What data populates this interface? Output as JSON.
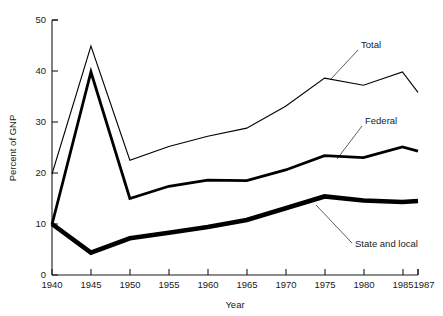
{
  "chart_data": {
    "type": "line",
    "title": "",
    "xlabel": "Year",
    "ylabel": "Percent of GNP",
    "x": [
      1940,
      1945,
      1950,
      1955,
      1960,
      1965,
      1970,
      1975,
      1980,
      1985,
      1987
    ],
    "xtick_labels": [
      "1940",
      "1945",
      "1950",
      "1955",
      "1960",
      "1965",
      "1970",
      "1975",
      "1980",
      "1985",
      "1987"
    ],
    "ytick_labels": [
      "0",
      "10",
      "20",
      "30",
      "40",
      "50"
    ],
    "yticks": [
      0,
      10,
      20,
      30,
      40,
      50
    ],
    "ylim": [
      0,
      50
    ],
    "xlim": [
      1940,
      1987
    ],
    "grid": false,
    "legend_position": "inline-annotations",
    "series": [
      {
        "name": "Total",
        "label": "Total",
        "values": [
          19.8,
          44.9,
          22.5,
          25.2,
          27.2,
          28.8,
          33.1,
          38.6,
          37.2,
          39.8,
          35.8
        ]
      },
      {
        "name": "Federal",
        "label": "Federal",
        "values": [
          9.9,
          39.8,
          15.0,
          17.4,
          18.6,
          18.5,
          20.6,
          23.4,
          23.0,
          25.1,
          24.3
        ]
      },
      {
        "name": "State and local",
        "label": "State and local",
        "values": [
          10.0,
          4.4,
          7.2,
          8.3,
          9.4,
          10.8,
          13.1,
          15.4,
          14.6,
          14.3,
          14.5
        ]
      }
    ],
    "annotations": [
      {
        "text": "Total",
        "series": "Total"
      },
      {
        "text": "Federal",
        "series": "Federal"
      },
      {
        "text": "State and local",
        "series": "State and local"
      }
    ]
  }
}
